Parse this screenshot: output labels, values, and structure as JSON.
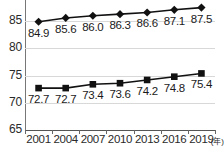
{
  "chart_data": {
    "type": "line",
    "title": "",
    "xlabel": "(年)",
    "ylabel": "",
    "categories": [
      "2001",
      "2004",
      "2007",
      "2010",
      "2013",
      "2016",
      "2019"
    ],
    "x_unit": "(年)",
    "ylim": [
      65,
      90
    ],
    "yticks": [
      65,
      70,
      75,
      80,
      85
    ],
    "ytick_labels": [
      "65",
      "70",
      "75",
      "80",
      "85"
    ],
    "grid": true,
    "legend": "none",
    "series": [
      {
        "name": "series-upper",
        "marker": "diamond",
        "color": "#111111",
        "values": [
          84.9,
          85.6,
          86.0,
          86.3,
          86.6,
          87.1,
          87.5
        ],
        "labels": [
          "84.9",
          "85.6",
          "86.0",
          "86.3",
          "86.6",
          "87.1",
          "87.5"
        ]
      },
      {
        "name": "series-lower",
        "marker": "square",
        "color": "#111111",
        "values": [
          72.7,
          72.7,
          73.4,
          73.6,
          74.2,
          74.8,
          75.4
        ],
        "labels": [
          "72.7",
          "72.7",
          "73.4",
          "73.6",
          "74.2",
          "74.8",
          "75.4"
        ]
      }
    ]
  }
}
